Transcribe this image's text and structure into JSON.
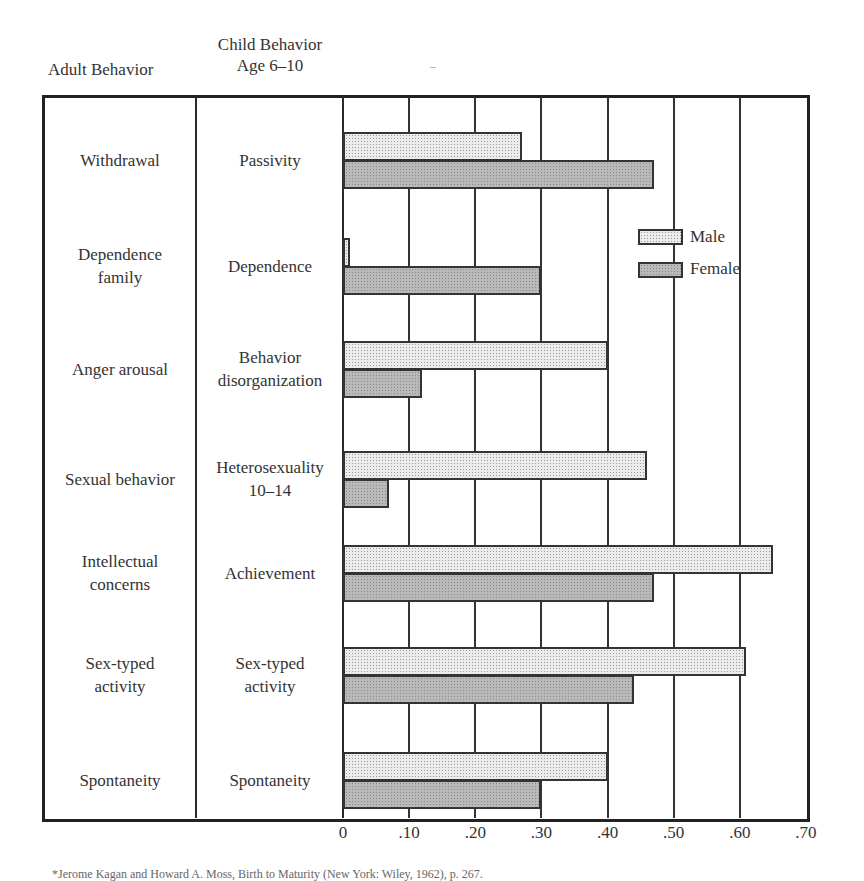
{
  "headers": {
    "adult": "Adult Behavior",
    "child_line1": "Child Behavior",
    "child_line2": "Age 6–10"
  },
  "rows": [
    {
      "adult": [
        "Withdrawal"
      ],
      "child": [
        "Passivity"
      ]
    },
    {
      "adult": [
        "Dependence",
        "family"
      ],
      "child": [
        "Dependence"
      ]
    },
    {
      "adult": [
        "Anger arousal"
      ],
      "child": [
        "Behavior",
        "disorganization"
      ]
    },
    {
      "adult": [
        "Sexual behavior"
      ],
      "child": [
        "Heterosexuality",
        "10–14"
      ]
    },
    {
      "adult": [
        "Intellectual",
        "concerns"
      ],
      "child": [
        "Achievement"
      ]
    },
    {
      "adult": [
        "Sex-typed",
        "activity"
      ],
      "child": [
        "Sex-typed",
        "activity"
      ]
    },
    {
      "adult": [
        "Spontaneity"
      ],
      "child": [
        "Spontaneity"
      ]
    }
  ],
  "legend": {
    "male": "Male",
    "female": "Female"
  },
  "axis": {
    "ticks": [
      "0",
      ".10",
      ".20",
      ".30",
      ".40",
      ".50",
      ".60",
      ".70"
    ]
  },
  "footnote": "*Jerome Kagan and Howard A. Moss, Birth to Maturity (New York: Wiley, 1962), p. 267.",
  "chart_data": {
    "type": "bar",
    "orientation": "horizontal",
    "title": "",
    "row_header_left": "Adult Behavior",
    "row_header_right": "Child Behavior Age 6–10",
    "categories": [
      "Withdrawal / Passivity",
      "Dependence family / Dependence",
      "Anger arousal / Behavior disorganization",
      "Sexual behavior / Heterosexuality 10–14",
      "Intellectual concerns / Achievement",
      "Sex-typed activity / Sex-typed activity",
      "Spontaneity / Spontaneity"
    ],
    "series": [
      {
        "name": "Male",
        "values": [
          0.27,
          0.01,
          0.4,
          0.46,
          0.65,
          0.61,
          0.4
        ]
      },
      {
        "name": "Female",
        "values": [
          0.47,
          0.3,
          0.12,
          0.07,
          0.47,
          0.44,
          0.3
        ]
      }
    ],
    "xlabel": "",
    "ylabel": "",
    "xlim": [
      0,
      0.7
    ],
    "xticks": [
      0,
      0.1,
      0.2,
      0.3,
      0.4,
      0.5,
      0.6,
      0.7
    ],
    "xtick_labels": [
      "0",
      ".10",
      ".20",
      ".30",
      ".40",
      ".50",
      ".60",
      ".70"
    ],
    "grid": "vertical lines at each tick",
    "legend_position": "upper right inside plot",
    "colors": {
      "male": "#ececec",
      "female": "#b9b9b9",
      "border": "#333333"
    }
  }
}
